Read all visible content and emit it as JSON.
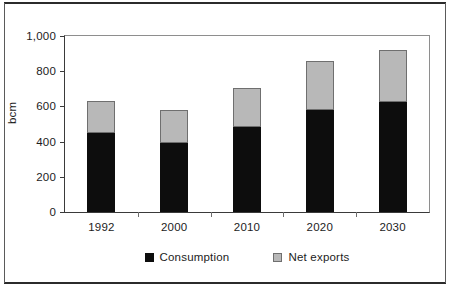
{
  "chart_data": {
    "type": "bar",
    "subtype": "stacked",
    "title": "",
    "xlabel": "",
    "ylabel": "bcm",
    "categories": [
      "1992",
      "2000",
      "2010",
      "2020",
      "2030"
    ],
    "series": [
      {
        "name": "Consumption",
        "color": "#0d0d0d",
        "values": [
          447,
          393,
          483,
          579,
          624
        ]
      },
      {
        "name": "Net exports",
        "color": "#b8b8b8",
        "values": [
          182,
          186,
          219,
          281,
          297
        ]
      }
    ],
    "totals": [
      629,
      579,
      702,
      860,
      921
    ],
    "ylim": [
      0,
      1000
    ],
    "yticks": [
      0,
      200,
      400,
      600,
      800,
      1000
    ],
    "ytick_labels": [
      "0",
      "200",
      "400",
      "600",
      "800",
      "1,000"
    ],
    "grid": false,
    "legend_position": "bottom-center"
  },
  "axis": {
    "y_title": "bcm"
  },
  "legend": {
    "items": [
      {
        "label": "Consumption",
        "swatch": "consumption"
      },
      {
        "label": "Net exports",
        "swatch": "exports"
      }
    ]
  }
}
